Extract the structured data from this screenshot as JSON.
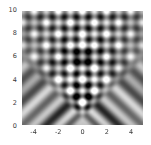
{
  "figure": {
    "title": "",
    "background_color": "#ffffff",
    "plot_background": "#8a8a8a",
    "frame_color": "#ffffff",
    "tick_label_color": "#3a3a3a"
  },
  "axes": {
    "x": {
      "label": "",
      "min": -5,
      "max": 5,
      "ticks": [
        -4,
        -2,
        0,
        2,
        4
      ],
      "tick_labels": [
        "-4",
        "-2",
        "0",
        "2",
        "4"
      ]
    },
    "y": {
      "label": "",
      "min": 0,
      "max": 10,
      "ticks": [
        0,
        2,
        4,
        6,
        8,
        10
      ],
      "tick_labels": [
        "0",
        "2",
        "4",
        "6",
        "8",
        "10"
      ]
    }
  },
  "chart_data": {
    "type": "heatmap",
    "title": "",
    "xlabel": "",
    "ylabel": "",
    "xlim": [
      -5,
      5
    ],
    "ylim": [
      0,
      10
    ],
    "grid": false,
    "legend": null,
    "colormap": "gray",
    "colormap_range": [
      0,
      1
    ],
    "features": [
      {
        "name": "source-point",
        "x": 0,
        "y": 0,
        "value": 0.62
      },
      {
        "name": "dark-focus",
        "x": 0,
        "y": 6,
        "value": 0.08
      },
      {
        "name": "bright-lobe-upper",
        "x": 0,
        "y": 8.4,
        "value": 0.95
      },
      {
        "name": "diamond-plateau-lower",
        "x": 0,
        "y": 2.2,
        "value": 0.55
      },
      {
        "name": "diamond-plateau-mid",
        "x": 0,
        "y": 4.4,
        "value": 0.58
      }
    ],
    "x_sample": [
      -5,
      -4,
      -3,
      -2,
      -1,
      0,
      1,
      2,
      3,
      4,
      5
    ],
    "y_sample": [
      0,
      1,
      2,
      3,
      4,
      5,
      6,
      7,
      8,
      9,
      10
    ],
    "values": [
      [
        0.52,
        0.5,
        0.5,
        0.52,
        0.56,
        0.6,
        0.56,
        0.52,
        0.5,
        0.5,
        0.52
      ],
      [
        0.48,
        0.42,
        0.44,
        0.5,
        0.56,
        0.58,
        0.56,
        0.5,
        0.44,
        0.42,
        0.48
      ],
      [
        0.4,
        0.3,
        0.38,
        0.52,
        0.56,
        0.56,
        0.56,
        0.52,
        0.38,
        0.3,
        0.4
      ],
      [
        0.34,
        0.22,
        0.34,
        0.52,
        0.56,
        0.56,
        0.56,
        0.52,
        0.34,
        0.22,
        0.34
      ],
      [
        0.46,
        0.34,
        0.24,
        0.4,
        0.56,
        0.58,
        0.56,
        0.4,
        0.24,
        0.34,
        0.46
      ],
      [
        0.56,
        0.48,
        0.3,
        0.26,
        0.46,
        0.52,
        0.46,
        0.26,
        0.3,
        0.48,
        0.56
      ],
      [
        0.58,
        0.56,
        0.44,
        0.24,
        0.22,
        0.08,
        0.22,
        0.24,
        0.44,
        0.56,
        0.58
      ],
      [
        0.54,
        0.6,
        0.52,
        0.38,
        0.66,
        0.86,
        0.66,
        0.38,
        0.52,
        0.6,
        0.54
      ],
      [
        0.5,
        0.58,
        0.62,
        0.46,
        0.3,
        0.2,
        0.3,
        0.46,
        0.62,
        0.58,
        0.5
      ],
      [
        0.52,
        0.56,
        0.6,
        0.64,
        0.58,
        0.9,
        0.58,
        0.64,
        0.6,
        0.56,
        0.52
      ],
      [
        0.54,
        0.52,
        0.56,
        0.62,
        0.72,
        0.6,
        0.72,
        0.62,
        0.56,
        0.52,
        0.54
      ]
    ]
  }
}
